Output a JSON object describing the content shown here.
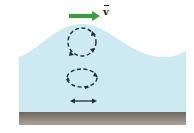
{
  "diagram": {
    "type": "water-wave-particle-motion",
    "velocity_label": "v",
    "velocity_vector_symbol": "arrow-over",
    "colors": {
      "water": "#cdeaf2",
      "seabed_top": "#6d675f",
      "seabed_bottom": "#aaa39a",
      "velocity_arrow": "#3d9a3d",
      "orbit_path": "#1e2a33"
    },
    "elements": [
      {
        "name": "velocity-arrow",
        "direction": "right"
      },
      {
        "name": "surface-orbit",
        "shape": "circle",
        "motion": "clockwise"
      },
      {
        "name": "mid-depth-orbit",
        "shape": "ellipse",
        "motion": "clockwise"
      },
      {
        "name": "bottom-oscillation",
        "shape": "horizontal-line",
        "motion": "back-and-forth"
      }
    ]
  }
}
